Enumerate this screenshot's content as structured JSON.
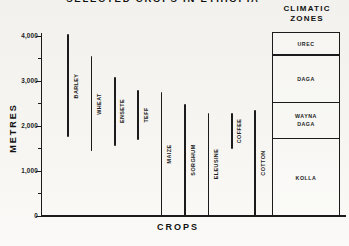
{
  "colors": {
    "ink": "#1b1b1b",
    "paper": "#f5f4f0"
  },
  "chart_data": {
    "type": "bar",
    "subtype": "vertical-range-lines",
    "title": "SELECTED CROPS IN ETHIOPIA",
    "title_note": "title clipped at top edge of screenshot",
    "xlabel": "CROPS",
    "ylabel": "METRES",
    "ylim": [
      0,
      4100
    ],
    "grid": false,
    "yticks_major": [
      0,
      1000,
      2000,
      3000,
      4000
    ],
    "ytick_labels": [
      "0",
      "1,000",
      "2,000",
      "3,000",
      "4,000"
    ],
    "yticks_minor": [
      500,
      1500,
      2500,
      3500
    ],
    "categories": [
      "BARLEY",
      "WHEAT",
      "ENSETE",
      "TEFF",
      "MAIZE",
      "SORGHUM",
      "ELEUSINE",
      "COFFEE",
      "COTTON"
    ],
    "ranges_m": [
      [
        1750,
        4050
      ],
      [
        1450,
        3550
      ],
      [
        1550,
        3100
      ],
      [
        1700,
        2800
      ],
      [
        0,
        2750
      ],
      [
        0,
        2500
      ],
      [
        0,
        2300
      ],
      [
        1500,
        2300
      ],
      [
        0,
        2350
      ]
    ],
    "zones_header": [
      "CLIMATIC",
      "ZONES"
    ],
    "zones": [
      {
        "label": "UREC",
        "from_m": 3600,
        "to_m": 4100
      },
      {
        "label": "DAGA",
        "from_m": 2550,
        "to_m": 3600
      },
      {
        "label": "WAYNA DAGA",
        "from_m": 1750,
        "to_m": 2550
      },
      {
        "label": "KOLLA",
        "from_m": 0,
        "to_m": 1750
      }
    ]
  }
}
